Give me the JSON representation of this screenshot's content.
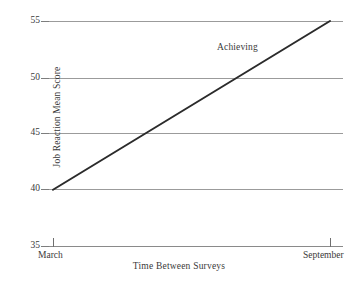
{
  "chart_data": {
    "type": "line",
    "title": "",
    "xlabel": "Time Between Surveys",
    "ylabel": "Job Reaction Mean Score",
    "categories": [
      "March",
      "September"
    ],
    "x_tick_labels": [
      "March",
      "September"
    ],
    "y_tick_labels": [
      "55",
      "50",
      "45",
      "40",
      "35"
    ],
    "y_ticks": [
      55,
      50,
      45,
      40,
      35
    ],
    "ylim": [
      35,
      55
    ],
    "grid": true,
    "legend_position": "inline-annotation",
    "series": [
      {
        "name": "Achieving",
        "x": [
          "March",
          "September"
        ],
        "values": [
          40,
          55
        ],
        "color": "#2b2b2b",
        "annotation": "Achieving"
      }
    ],
    "annotations": [
      {
        "text": "Achieving",
        "x": "midpoint-upper",
        "y": 53
      }
    ]
  },
  "axes": {
    "y_title": "Job Reaction Mean Score",
    "x_title": "Time Between Surveys",
    "y_labels": [
      {
        "value": "55"
      },
      {
        "value": "50"
      },
      {
        "value": "45"
      },
      {
        "value": "40"
      },
      {
        "value": "35"
      }
    ],
    "x_labels": [
      {
        "value": "March"
      },
      {
        "value": "September"
      }
    ]
  },
  "series_annotation": {
    "achieving": "Achieving"
  },
  "colors": {
    "line": "#2b2b2b",
    "grid": "#9b9b9b",
    "text": "#3a3a3a",
    "background": "#ffffff"
  }
}
